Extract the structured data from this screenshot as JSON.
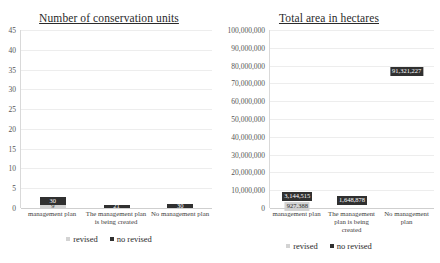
{
  "chart_data": [
    {
      "id": "number-of-conservation-units",
      "type": "bar",
      "subtype": "stacked-column",
      "title": "Number of conservation units",
      "xlabel": "",
      "ylabel": "",
      "ylim": [
        0,
        45
      ],
      "ytick_step": 5,
      "ytick_labels": [
        "45",
        "40",
        "35",
        "30",
        "25",
        "20",
        "15",
        "10",
        "5",
        "0"
      ],
      "grid": true,
      "legend_position": "bottom",
      "categories": [
        "management plan",
        "The management plan is being created",
        "No management plan"
      ],
      "series": [
        {
          "name": "revised",
          "color": "#d3d3d3",
          "values": [
            9,
            0,
            0
          ],
          "labels": [
            "9",
            "",
            ""
          ]
        },
        {
          "name": "no revised",
          "color": "#303030",
          "values": [
            30,
            21,
            30
          ],
          "labels": [
            "30",
            "21",
            "30"
          ]
        }
      ],
      "totals": [
        39,
        21,
        30
      ]
    },
    {
      "id": "total-area-in-hectares",
      "type": "bar",
      "subtype": "stacked-column",
      "title": "Total area in hectares",
      "xlabel": "",
      "ylabel": "",
      "ylim": [
        0,
        100000000
      ],
      "ytick_step": 10000000,
      "ytick_labels": [
        "100,000,000",
        "90,000,000",
        "80,000,000",
        "70,000,000",
        "60,000,000",
        "50,000,000",
        "40,000,000",
        "30,000,000",
        "20,000,000",
        "10,000,000",
        "0"
      ],
      "grid": true,
      "legend_position": "bottom",
      "categories": [
        "management plan",
        "The management plan is being created",
        "No management plan"
      ],
      "series": [
        {
          "name": "revised",
          "color": "#d3d3d3",
          "values": [
            927388,
            0,
            0
          ],
          "labels": [
            "927,388",
            "",
            ""
          ]
        },
        {
          "name": "no revised",
          "color": "#303030",
          "values": [
            3144515,
            1648878,
            91321227
          ],
          "labels": [
            "3,144,515",
            "1,648,878",
            "91,321,227"
          ]
        }
      ],
      "totals": [
        4071903,
        1648878,
        91321227
      ]
    }
  ],
  "legend": {
    "revised_label": "revised",
    "no_revised_label": "no revised"
  },
  "colors": {
    "revised": "#d3d3d3",
    "no_revised": "#303030",
    "gridline": "#ededed",
    "axis": "#d9d9d9",
    "background": "#ffffff"
  }
}
